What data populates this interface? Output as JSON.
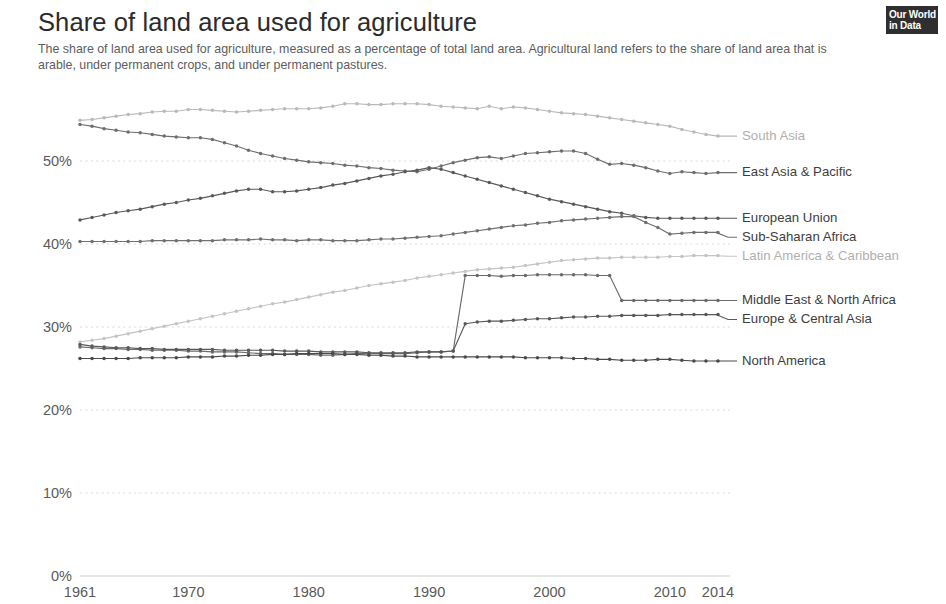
{
  "header": {
    "title": "Share of land area used for agriculture",
    "subtitle": "The share of land area used for agriculture, measured as a percentage of total land area. Agricultural land refers to the share of land area that is arable, under permanent crops, and under permanent pastures."
  },
  "logo": {
    "line1": "Our World",
    "line2": "in Data"
  },
  "chart_data": {
    "type": "line",
    "title": "Share of land area used for agriculture",
    "subtitle": "The share of land area used for agriculture, measured as a percentage of total land area. Agricultural land refers to the share of land area that is arable, under permanent crops, and under permanent pastures.",
    "xlabel": "",
    "ylabel": "",
    "xlim": [
      1961,
      2014
    ],
    "ylim": [
      0,
      55
    ],
    "grid": "horizontal",
    "legend_position": "right-inline",
    "x_tick_labels": [
      "1961",
      "1970",
      "1980",
      "1990",
      "2000",
      "2010",
      "2014"
    ],
    "x_ticks": [
      1961,
      1970,
      1980,
      1990,
      2000,
      2010,
      2014
    ],
    "y_tick_labels": [
      "0%",
      "10%",
      "20%",
      "30%",
      "40%",
      "50%"
    ],
    "y_ticks": [
      0,
      10,
      20,
      30,
      40,
      50
    ],
    "x": [
      1961,
      1962,
      1963,
      1964,
      1965,
      1966,
      1967,
      1968,
      1969,
      1970,
      1971,
      1972,
      1973,
      1974,
      1975,
      1976,
      1977,
      1978,
      1979,
      1980,
      1981,
      1982,
      1983,
      1984,
      1985,
      1986,
      1987,
      1988,
      1989,
      1990,
      1991,
      1992,
      1993,
      1994,
      1995,
      1996,
      1997,
      1998,
      1999,
      2000,
      2001,
      2002,
      2003,
      2004,
      2005,
      2006,
      2007,
      2008,
      2009,
      2010,
      2011,
      2012,
      2013,
      2014
    ],
    "series": [
      {
        "name": "South Asia",
        "color": "#b9b9b9",
        "label_color": "#b0b0b0",
        "end_value": 53.0,
        "values": [
          54.9,
          55.0,
          55.2,
          55.4,
          55.6,
          55.7,
          55.9,
          56.0,
          56.0,
          56.2,
          56.2,
          56.1,
          56.0,
          55.9,
          56.0,
          56.1,
          56.2,
          56.3,
          56.3,
          56.3,
          56.4,
          56.6,
          56.9,
          56.9,
          56.8,
          56.8,
          56.9,
          56.9,
          56.9,
          56.8,
          56.6,
          56.5,
          56.4,
          56.3,
          56.6,
          56.3,
          56.5,
          56.4,
          56.2,
          56.0,
          55.8,
          55.7,
          55.6,
          55.4,
          55.2,
          55.0,
          54.8,
          54.6,
          54.4,
          54.2,
          53.8,
          53.5,
          53.2,
          53.0
        ]
      },
      {
        "name": "East Asia & Pacific",
        "color": "#6e6e6e",
        "label_color": "#3d3d3d",
        "end_value": 48.6,
        "values": [
          54.4,
          54.2,
          53.9,
          53.7,
          53.5,
          53.4,
          53.2,
          53.0,
          52.9,
          52.8,
          52.8,
          52.6,
          52.2,
          51.8,
          51.3,
          50.9,
          50.6,
          50.3,
          50.1,
          49.9,
          49.8,
          49.7,
          49.5,
          49.4,
          49.2,
          49.1,
          48.9,
          48.8,
          48.7,
          49.0,
          49.4,
          49.8,
          50.1,
          50.4,
          50.5,
          50.3,
          50.6,
          50.9,
          51.0,
          51.1,
          51.2,
          51.2,
          50.9,
          50.2,
          49.6,
          49.7,
          49.5,
          49.2,
          48.8,
          48.5,
          48.7,
          48.6,
          48.5,
          48.6
        ]
      },
      {
        "name": "European Union",
        "color": "#595959",
        "label_color": "#3d3d3d",
        "end_value": 43.1,
        "values": [
          42.9,
          43.2,
          43.5,
          43.8,
          44.0,
          44.2,
          44.5,
          44.8,
          45.0,
          45.3,
          45.5,
          45.8,
          46.1,
          46.4,
          46.6,
          46.6,
          46.3,
          46.3,
          46.4,
          46.6,
          46.8,
          47.1,
          47.3,
          47.6,
          47.9,
          48.2,
          48.4,
          48.7,
          48.9,
          49.2,
          49.0,
          48.6,
          48.2,
          47.8,
          47.4,
          47.0,
          46.6,
          46.2,
          45.8,
          45.4,
          45.1,
          44.8,
          44.5,
          44.2,
          43.9,
          43.7,
          43.4,
          43.2,
          43.1,
          43.1,
          43.1,
          43.1,
          43.1,
          43.1
        ]
      },
      {
        "name": "Sub-Saharan Africa",
        "color": "#707070",
        "label_color": "#3d3d3d",
        "end_value": 41.4,
        "values": [
          40.3,
          40.3,
          40.3,
          40.3,
          40.3,
          40.3,
          40.4,
          40.4,
          40.4,
          40.4,
          40.4,
          40.4,
          40.5,
          40.5,
          40.5,
          40.6,
          40.5,
          40.5,
          40.4,
          40.5,
          40.5,
          40.4,
          40.4,
          40.4,
          40.5,
          40.6,
          40.6,
          40.7,
          40.8,
          40.9,
          41.0,
          41.2,
          41.4,
          41.6,
          41.8,
          42.0,
          42.2,
          42.3,
          42.5,
          42.6,
          42.8,
          42.9,
          43.0,
          43.1,
          43.2,
          43.3,
          43.3,
          42.6,
          42.0,
          41.2,
          41.3,
          41.4,
          41.4,
          41.4
        ]
      },
      {
        "name": "Latin America & Caribbean",
        "color": "#c4c4c4",
        "label_color": "#b0b0b0",
        "end_value": 38.6,
        "values": [
          28.2,
          28.4,
          28.6,
          28.9,
          29.2,
          29.5,
          29.8,
          30.1,
          30.4,
          30.7,
          31.0,
          31.3,
          31.6,
          31.9,
          32.2,
          32.5,
          32.8,
          33.0,
          33.3,
          33.6,
          33.9,
          34.2,
          34.4,
          34.7,
          35.0,
          35.2,
          35.4,
          35.6,
          35.9,
          36.1,
          36.3,
          36.5,
          36.7,
          36.9,
          37.0,
          37.1,
          37.2,
          37.4,
          37.6,
          37.8,
          38.0,
          38.1,
          38.2,
          38.3,
          38.3,
          38.4,
          38.4,
          38.4,
          38.4,
          38.5,
          38.5,
          38.6,
          38.6,
          38.6
        ]
      },
      {
        "name": "Middle East & North Africa",
        "color": "#6a6a6a",
        "label_color": "#3d3d3d",
        "end_value": 33.2,
        "values": [
          27.6,
          27.5,
          27.4,
          27.4,
          27.3,
          27.3,
          27.2,
          27.2,
          27.2,
          27.1,
          27.1,
          27.0,
          27.0,
          27.0,
          26.9,
          26.8,
          26.8,
          26.7,
          26.7,
          26.7,
          26.6,
          26.6,
          26.7,
          26.8,
          26.8,
          26.8,
          26.8,
          26.8,
          26.9,
          27.0,
          27.0,
          27.1,
          36.2,
          36.2,
          36.2,
          36.1,
          36.2,
          36.2,
          36.3,
          36.3,
          36.3,
          36.3,
          36.3,
          36.2,
          36.2,
          33.2,
          33.2,
          33.2,
          33.2,
          33.2,
          33.2,
          33.2,
          33.2,
          33.2
        ]
      },
      {
        "name": "Europe & Central Asia",
        "color": "#585858",
        "label_color": "#3d3d3d",
        "end_value": 31.5,
        "values": [
          27.9,
          27.7,
          27.6,
          27.5,
          27.5,
          27.4,
          27.4,
          27.3,
          27.3,
          27.3,
          27.3,
          27.3,
          27.2,
          27.2,
          27.2,
          27.2,
          27.2,
          27.1,
          27.1,
          27.1,
          27.0,
          27.0,
          27.0,
          27.0,
          26.9,
          26.9,
          26.9,
          26.9,
          27.0,
          27.0,
          27.0,
          27.1,
          30.4,
          30.6,
          30.7,
          30.7,
          30.8,
          30.9,
          31.0,
          31.0,
          31.1,
          31.2,
          31.2,
          31.3,
          31.3,
          31.4,
          31.4,
          31.4,
          31.4,
          31.5,
          31.5,
          31.5,
          31.5,
          31.5
        ]
      },
      {
        "name": "North America",
        "color": "#4a4a4a",
        "label_color": "#3d3d3d",
        "end_value": 25.9,
        "values": [
          26.2,
          26.2,
          26.2,
          26.2,
          26.2,
          26.3,
          26.3,
          26.3,
          26.3,
          26.4,
          26.4,
          26.4,
          26.5,
          26.5,
          26.6,
          26.6,
          26.7,
          26.7,
          26.8,
          26.8,
          26.8,
          26.8,
          26.7,
          26.7,
          26.6,
          26.6,
          26.5,
          26.5,
          26.4,
          26.4,
          26.4,
          26.4,
          26.4,
          26.4,
          26.4,
          26.4,
          26.4,
          26.3,
          26.3,
          26.3,
          26.3,
          26.2,
          26.2,
          26.1,
          26.1,
          26.0,
          26.0,
          26.0,
          26.1,
          26.1,
          26.0,
          25.9,
          25.9,
          25.9
        ]
      }
    ]
  }
}
